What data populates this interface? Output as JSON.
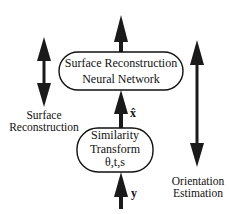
{
  "diagram": {
    "top_box": {
      "line1": "Surface Reconstruction",
      "line2": "Neural Network"
    },
    "bottom_box": {
      "line1": "Similarity",
      "line2": "Transform",
      "line3": "θ,t,s"
    },
    "labels": {
      "x_hat": "x̂",
      "y": "y",
      "left_line1": "Surface",
      "left_line2": "Reconstruction",
      "right_line1": "Orientation",
      "right_line2": "Estimation"
    },
    "arrows": [
      {
        "id": "output-arrow",
        "direction": "up"
      },
      {
        "id": "x-hat-arrow",
        "direction": "up"
      },
      {
        "id": "y-input-arrow",
        "direction": "up"
      },
      {
        "id": "surface-reconstruction-arrow",
        "direction": "bidirectional"
      },
      {
        "id": "orientation-estimation-arrow",
        "direction": "bidirectional"
      }
    ],
    "colors": {
      "stroke": "#111111",
      "arrow_fill": "#1a1a1a",
      "background": "#ffffff"
    }
  }
}
